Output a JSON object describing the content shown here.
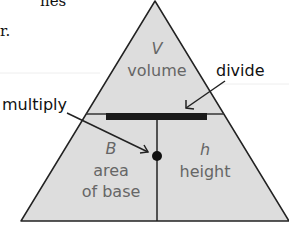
{
  "diagram": {
    "top_section": {
      "symbol": "V",
      "name": "volume"
    },
    "bottom_left": {
      "symbol": "B",
      "name_line1": "area",
      "name_line2": "of base"
    },
    "bottom_right": {
      "symbol": "h",
      "name": "height"
    },
    "callouts": {
      "divide": "divide",
      "multiply": "multiply"
    },
    "page_fragments": {
      "line1": "nes",
      "line2": "r."
    },
    "colors": {
      "fill": "#dddddd",
      "stroke": "#222222",
      "bar": "#1a1a1a",
      "label": "#666666"
    }
  }
}
